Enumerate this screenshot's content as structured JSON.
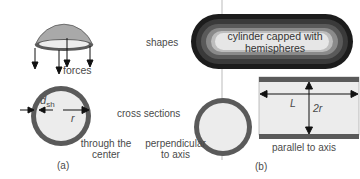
{
  "panel_a": {
    "label": "(a)",
    "forces_label": "forces",
    "cross_section_label_line1": "through the",
    "cross_section_label_line2": "center",
    "thickness_symbol": "d",
    "thickness_subscript": "sh",
    "radius_symbol": "r"
  },
  "row_labels": {
    "shapes": "shapes",
    "cross_sections": "cross sections"
  },
  "panel_b": {
    "label": "(b)",
    "capsule_line1": "cylinder capped with",
    "capsule_line2": "hemispheres",
    "perpendicular_line1": "perpendicular",
    "perpendicular_line2": "to axis",
    "parallel_label": "parallel to axis",
    "length_symbol": "L",
    "diameter_symbol": "2r"
  },
  "colors": {
    "shell": "#5a5a5a",
    "interior": "#ececec",
    "dome": "#a9a9a9",
    "capsule_outer": "#1e1e1e",
    "capsule_inner": "#f2f2f2"
  }
}
